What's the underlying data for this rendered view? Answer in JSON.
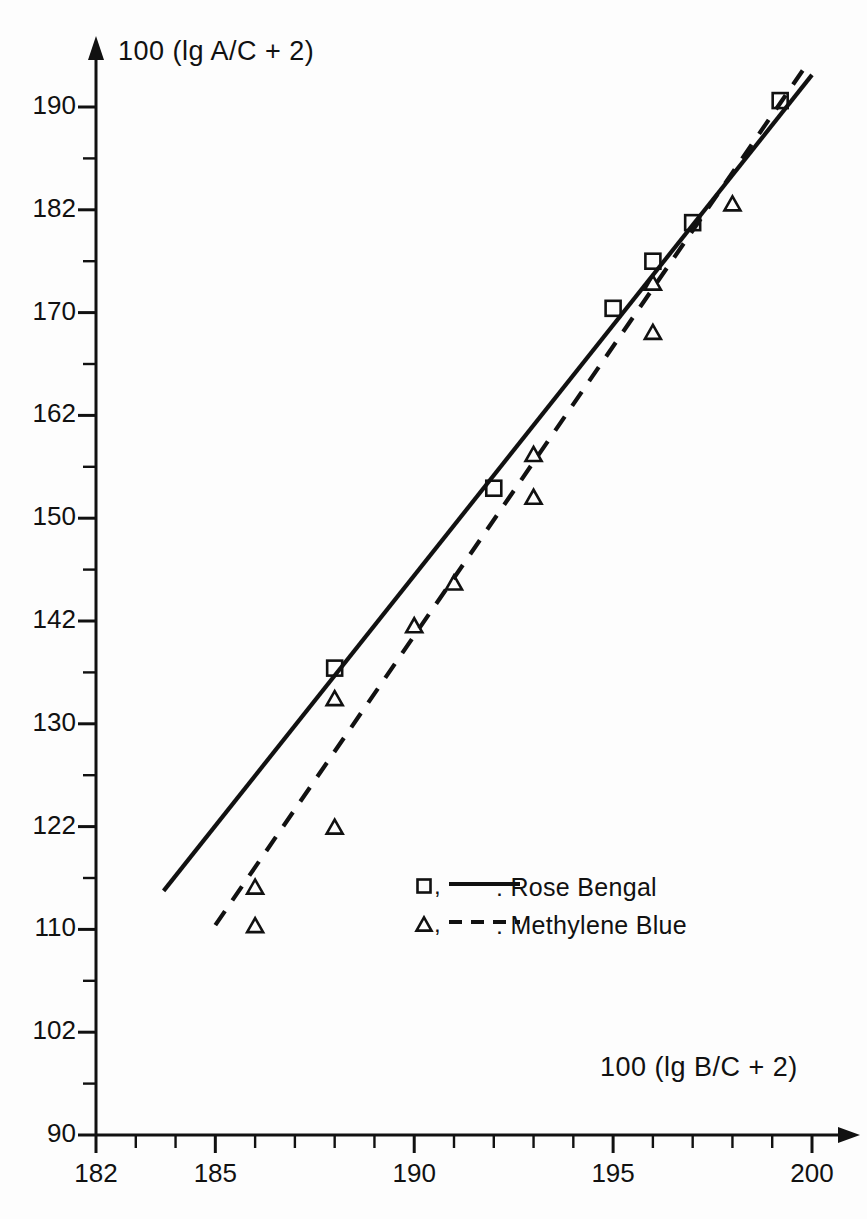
{
  "chart_data": {
    "type": "scatter",
    "title": "",
    "subtitle": "",
    "xlabel": "100 (lg B/C + 2)",
    "ylabel": "100 (lg A/C + 2)",
    "xlim": [
      182,
      200
    ],
    "ylim": [
      90,
      193
    ],
    "grid": false,
    "legend_position": "inside-lower-right",
    "x_ticks_major": [
      182,
      185,
      190,
      195,
      200
    ],
    "x_ticks_minor": [
      183,
      184,
      186,
      187,
      188,
      189,
      191,
      192,
      193,
      194,
      196,
      197,
      198,
      199
    ],
    "y_ticks_major": [
      90,
      102,
      110,
      122,
      130,
      142,
      150,
      162,
      170,
      182,
      190
    ],
    "y_ticks_minor": [
      94,
      98,
      106,
      114,
      118,
      126,
      134,
      138,
      146,
      154,
      158,
      166,
      174,
      178,
      186
    ],
    "y_scale_note": "non-linear probability-type scale, ticks evenly spaced as listed",
    "series": [
      {
        "name": "Rose Bengal",
        "marker": "square",
        "line": "solid",
        "legend_label": "□, —— : Rose Bengal",
        "points": [
          {
            "x": 188.0,
            "y": 136.5
          },
          {
            "x": 192.0,
            "y": 153.5
          },
          {
            "x": 195.0,
            "y": 170.5
          },
          {
            "x": 196.0,
            "y": 176.0
          },
          {
            "x": 197.0,
            "y": 180.5
          },
          {
            "x": 199.2,
            "y": 190.5
          }
        ],
        "fit_line": {
          "x1": 183.7,
          "y1": 114.5,
          "x2": 200.0,
          "y2": 192.5
        }
      },
      {
        "name": "Methylene Blue",
        "marker": "triangle",
        "line": "dashed",
        "legend_label": "△, - - - : Methylene Blue",
        "points": [
          {
            "x": 186.0,
            "y": 110.5
          },
          {
            "x": 186.0,
            "y": 115.0
          },
          {
            "x": 188.0,
            "y": 122.0
          },
          {
            "x": 188.0,
            "y": 133.0
          },
          {
            "x": 190.0,
            "y": 141.5
          },
          {
            "x": 191.0,
            "y": 145.0
          },
          {
            "x": 193.0,
            "y": 152.5
          },
          {
            "x": 193.0,
            "y": 157.5
          },
          {
            "x": 196.0,
            "y": 168.5
          },
          {
            "x": 196.0,
            "y": 173.5
          },
          {
            "x": 198.0,
            "y": 182.5
          }
        ],
        "fit_line": {
          "x1": 185.0,
          "y1": 110.5,
          "x2": 199.8,
          "y2": 193.0
        }
      }
    ]
  },
  "legend": {
    "rows": [
      {
        "marker": "square",
        "line": "solid",
        "label": ": Rose Bengal",
        "marker_text": "□,"
      },
      {
        "marker": "triangle",
        "line": "dashed",
        "label": ": Methylene Blue",
        "marker_text": "△,"
      }
    ]
  },
  "colors": {
    "ink": "#111111",
    "paper": "#fdfdfd"
  }
}
